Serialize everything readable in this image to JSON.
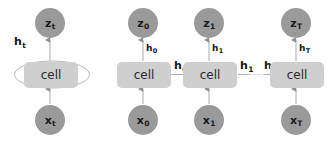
{
  "figure": {
    "colors": {
      "node_fill": "#9a9a9a",
      "cell_fill": "#cfcfcf",
      "edge_stroke": "#aaaaaa",
      "text": "#1a1a1a",
      "background": "#ffffff"
    }
  },
  "folded": {
    "output_node": {
      "base": "z",
      "sub": "t"
    },
    "input_node": {
      "base": "x",
      "sub": "t"
    },
    "cell_label": "cell",
    "recurrent_label": {
      "base": "h",
      "sub": "t"
    }
  },
  "unrolled": {
    "cell_label": "cell",
    "steps": [
      {
        "output_node": {
          "base": "z",
          "sub": "0"
        },
        "input_node": {
          "base": "x",
          "sub": "0"
        },
        "cell_label": "cell",
        "vertical_state": {
          "base": "h",
          "sub": "0"
        },
        "outgoing_state": {
          "base": "h",
          "sub": "0"
        }
      },
      {
        "output_node": {
          "base": "z",
          "sub": "1"
        },
        "input_node": {
          "base": "x",
          "sub": "1"
        },
        "cell_label": "cell",
        "vertical_state": {
          "base": "h",
          "sub": "1"
        },
        "outgoing_state": {
          "base": "h",
          "sub": "1"
        }
      },
      {
        "output_node": {
          "base": "z",
          "sub": "T"
        },
        "input_node": {
          "base": "x",
          "sub": "T"
        },
        "cell_label": "cell",
        "vertical_state": {
          "base": "h",
          "sub": "T"
        },
        "incoming_state": {
          "base": "h",
          "sub": "T-1"
        }
      }
    ]
  }
}
